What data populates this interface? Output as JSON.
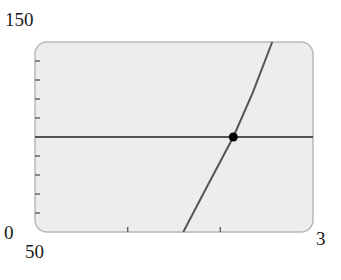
{
  "chart_data": {
    "type": "line",
    "title": "",
    "xlabel": "",
    "ylabel": "",
    "xlim": [
      0,
      3
    ],
    "ylim": [
      0,
      150
    ],
    "x_tick_labels": {
      "min": "0",
      "max": "3"
    },
    "y_tick_labels": {
      "min": "0",
      "max": "150"
    },
    "extra_label": "50",
    "x_ticks": [
      1,
      2
    ],
    "y_ticks": [
      15,
      30,
      45,
      60,
      90,
      105,
      120,
      135
    ],
    "grid": false,
    "series": [
      {
        "name": "horizontal line",
        "x": [
          0,
          3
        ],
        "y": [
          75,
          75
        ]
      },
      {
        "name": "increasing curve",
        "x": [
          1.6,
          1.85,
          2.14,
          2.35,
          2.56
        ],
        "y": [
          0,
          35,
          75,
          110,
          150
        ]
      }
    ],
    "annotations": [
      {
        "type": "point",
        "x": 2.14,
        "y": 75,
        "label": "intersection"
      }
    ]
  },
  "labels": {
    "ymax": "150",
    "ymin": "0",
    "xmin": "50",
    "xmax": "3"
  },
  "colors": {
    "plot_bg": "#ededed",
    "frame": "#b8b8b8",
    "line": "#555555",
    "point": "#000000"
  }
}
